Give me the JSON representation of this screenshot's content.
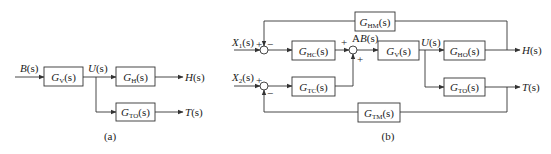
{
  "panel_a": {
    "caption": "(a)",
    "input": {
      "label": "B",
      "arg": "(s)"
    },
    "blocks": [
      {
        "id": "GV",
        "main": "G",
        "sub": "V",
        "arg": "(s)"
      },
      {
        "id": "GH",
        "main": "G",
        "sub": "H",
        "arg": "(s)"
      },
      {
        "id": "GTO",
        "main": "G",
        "sub": "TO",
        "arg": "(s)"
      }
    ],
    "signals": {
      "u": {
        "label": "U",
        "arg": "(s)"
      },
      "h": {
        "label": "H",
        "arg": "(s)"
      },
      "t": {
        "label": "T",
        "arg": "(s)"
      }
    }
  },
  "panel_b": {
    "caption": "(b)",
    "inputs": [
      {
        "label": "X",
        "sub": "1",
        "arg": "(s)"
      },
      {
        "label": "X",
        "sub": "2",
        "arg": "(s)"
      }
    ],
    "blocks": [
      {
        "id": "GHM",
        "main": "G",
        "sub": "HM",
        "arg": "(s)"
      },
      {
        "id": "GHC",
        "main": "G",
        "sub": "HC",
        "arg": "(s)"
      },
      {
        "id": "GV",
        "main": "G",
        "sub": "V",
        "arg": "(s)"
      },
      {
        "id": "GHO",
        "main": "G",
        "sub": "HO",
        "arg": "(s)"
      },
      {
        "id": "GTC",
        "main": "G",
        "sub": "TC",
        "arg": "(s)"
      },
      {
        "id": "GTO",
        "main": "G",
        "sub": "TO",
        "arg": "(s)"
      },
      {
        "id": "GTM",
        "main": "G",
        "sub": "TM",
        "arg": "(s)"
      }
    ],
    "signals": {
      "point_a": "A",
      "b": {
        "label": "B",
        "arg": "(s)"
      },
      "u": {
        "label": "U",
        "arg": "(s)"
      },
      "h": {
        "label": "H",
        "arg": "(s)"
      },
      "t": {
        "label": "T",
        "arg": "(s)"
      }
    },
    "signs": {
      "plus": "+",
      "minus": "−"
    }
  }
}
